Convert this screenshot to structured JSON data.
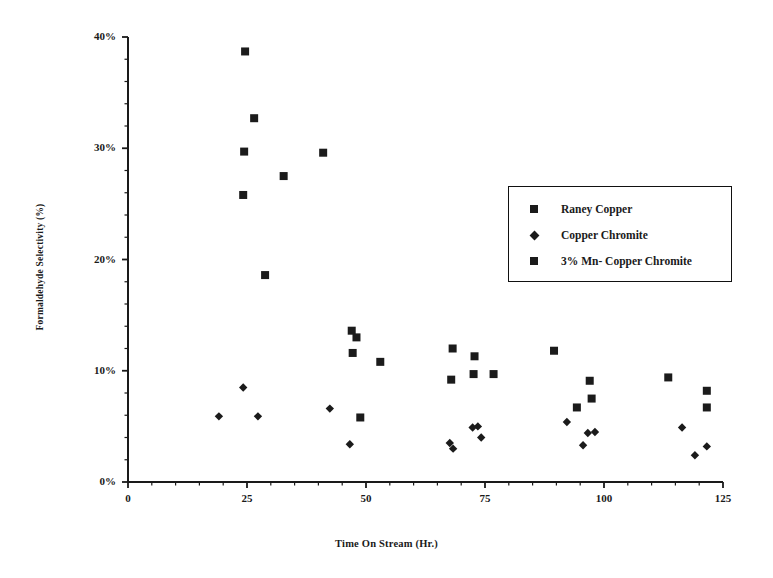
{
  "chart_data": {
    "type": "scatter",
    "title": "",
    "xlabel": "Time On Stream (Hr.)",
    "ylabel": "Formaldehyde Selectivity (%)",
    "xlim": [
      0,
      125
    ],
    "ylim": [
      0,
      40
    ],
    "xticks": [
      0,
      25,
      50,
      75,
      100,
      125
    ],
    "xtick_labels": [
      "0",
      "25",
      "50",
      "75",
      "100",
      "125"
    ],
    "yticks": [
      0,
      10,
      20,
      30,
      40
    ],
    "ytick_labels": [
      "0%",
      "10%",
      "20%",
      "30%",
      "40%"
    ],
    "x_minor_tick_interval": 5,
    "y_minor_tick_interval": 2,
    "grid": false,
    "legend_position": "upper right inside",
    "series": [
      {
        "name": "Raney Copper",
        "marker": "square",
        "color": "#1b1b1b",
        "points": [
          [
            24.6,
            38.7
          ],
          [
            26.5,
            32.7
          ],
          [
            24.4,
            29.7
          ],
          [
            32.7,
            27.5
          ],
          [
            24.2,
            25.8
          ],
          [
            41.0,
            29.6
          ],
          [
            28.8,
            18.6
          ],
          [
            47.0,
            13.6
          ],
          [
            48.0,
            13.0
          ],
          [
            47.2,
            11.6
          ],
          [
            53.0,
            10.8
          ],
          [
            48.8,
            5.8
          ],
          [
            72.8,
            11.3
          ],
          [
            67.9,
            9.2
          ],
          [
            72.6,
            9.7
          ],
          [
            76.8,
            9.7
          ],
          [
            68.2,
            12.0
          ],
          [
            97.0,
            9.1
          ],
          [
            97.4,
            7.5
          ],
          [
            94.3,
            6.7
          ],
          [
            113.5,
            9.4
          ],
          [
            121.6,
            8.2
          ],
          [
            121.6,
            6.7
          ],
          [
            89.5,
            11.8
          ]
        ]
      },
      {
        "name": "Copper Chromite",
        "marker": "diamond",
        "color": "#1b1b1b",
        "points": [
          [
            19.1,
            5.9
          ],
          [
            24.2,
            8.5
          ],
          [
            27.3,
            5.9
          ],
          [
            42.4,
            6.6
          ],
          [
            46.6,
            3.4
          ],
          [
            67.6,
            3.5
          ],
          [
            68.3,
            3.0
          ],
          [
            72.4,
            4.9
          ],
          [
            73.5,
            5.0
          ],
          [
            74.2,
            4.0
          ],
          [
            92.2,
            5.4
          ],
          [
            98.1,
            4.5
          ],
          [
            95.6,
            3.3
          ],
          [
            96.6,
            4.4
          ],
          [
            116.4,
            4.9
          ],
          [
            119.1,
            2.4
          ],
          [
            121.6,
            3.2
          ]
        ]
      },
      {
        "name": "3% Mn- Copper Chromite",
        "marker": "square",
        "color": "#1b1b1b",
        "points": []
      }
    ]
  },
  "legend": {
    "entries": [
      {
        "label": "Raney Copper",
        "marker": "square"
      },
      {
        "label": "Copper Chromite",
        "marker": "diamond"
      },
      {
        "label": "3% Mn- Copper Chromite",
        "marker": "square"
      }
    ]
  },
  "axes": {
    "x_title": "Time On Stream (Hr.)",
    "y_title": "Formaldehyde Selectivity (%)"
  }
}
